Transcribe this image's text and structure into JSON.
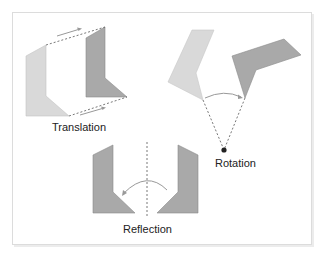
{
  "diagram": {
    "labels": {
      "translation": "Translation",
      "rotation": "Rotation",
      "reflection": "Reflection"
    },
    "colors": {
      "light_shape": "#d6d6d6",
      "dark_shape": "#a8a8a8",
      "line": "#666666",
      "arrow": "#999999",
      "pivot": "#222222"
    }
  }
}
